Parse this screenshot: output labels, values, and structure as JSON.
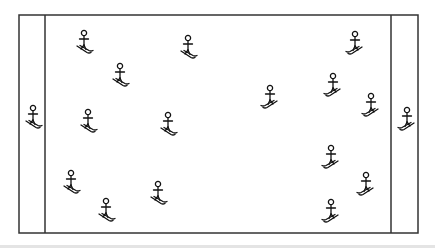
{
  "diagram": {
    "type": "field-layout",
    "colors": {
      "line": "#333333",
      "figure": "#111111",
      "background": "#ffffff",
      "band": "#e4e4e4"
    },
    "field": {
      "x": 19,
      "y": 15,
      "width": 399,
      "height": 218
    },
    "end_zones": [
      {
        "side": "left",
        "line_x": 45
      },
      {
        "side": "right",
        "line_x": 391
      }
    ],
    "skiers": [
      {
        "x": 84,
        "y": 33,
        "facing": "left"
      },
      {
        "x": 120,
        "y": 66,
        "facing": "left"
      },
      {
        "x": 188,
        "y": 38,
        "facing": "left"
      },
      {
        "x": 88,
        "y": 112,
        "facing": "left"
      },
      {
        "x": 168,
        "y": 115,
        "facing": "left"
      },
      {
        "x": 71,
        "y": 173,
        "facing": "left"
      },
      {
        "x": 106,
        "y": 201,
        "facing": "left"
      },
      {
        "x": 158,
        "y": 184,
        "facing": "left"
      },
      {
        "x": 33,
        "y": 108,
        "facing": "left"
      },
      {
        "x": 355,
        "y": 34,
        "facing": "right"
      },
      {
        "x": 270,
        "y": 88,
        "facing": "right"
      },
      {
        "x": 333,
        "y": 76,
        "facing": "right"
      },
      {
        "x": 371,
        "y": 96,
        "facing": "right"
      },
      {
        "x": 331,
        "y": 148,
        "facing": "right"
      },
      {
        "x": 366,
        "y": 175,
        "facing": "right"
      },
      {
        "x": 331,
        "y": 202,
        "facing": "right"
      },
      {
        "x": 407,
        "y": 110,
        "facing": "right"
      }
    ]
  }
}
